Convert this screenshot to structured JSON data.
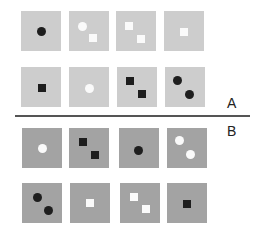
{
  "labels": {
    "a": "A",
    "b": "B"
  },
  "colors": {
    "tile_a": "#cdcdcd",
    "tile_b": "#a3a3a3",
    "black": "#1e1e1e",
    "white": "#fafafa",
    "divider": "#555555"
  },
  "sections": {
    "A": {
      "rows": [
        [
          {
            "shapes": [
              {
                "type": "circle",
                "color": "black"
              }
            ]
          },
          {
            "shapes": [
              {
                "type": "circle",
                "color": "white"
              },
              {
                "type": "square",
                "color": "white"
              }
            ]
          },
          {
            "shapes": [
              {
                "type": "square",
                "color": "white"
              },
              {
                "type": "square",
                "color": "white"
              }
            ]
          },
          {
            "shapes": [
              {
                "type": "square",
                "color": "white"
              }
            ]
          }
        ],
        [
          {
            "shapes": [
              {
                "type": "square",
                "color": "black"
              }
            ]
          },
          {
            "shapes": [
              {
                "type": "circle",
                "color": "white"
              }
            ]
          },
          {
            "shapes": [
              {
                "type": "square",
                "color": "black"
              },
              {
                "type": "square",
                "color": "black"
              }
            ]
          },
          {
            "shapes": [
              {
                "type": "circle",
                "color": "black"
              },
              {
                "type": "circle",
                "color": "black"
              }
            ]
          }
        ]
      ]
    },
    "B": {
      "rows": [
        [
          {
            "shapes": [
              {
                "type": "circle",
                "color": "white"
              }
            ]
          },
          {
            "shapes": [
              {
                "type": "square",
                "color": "black"
              },
              {
                "type": "square",
                "color": "black"
              }
            ]
          },
          {
            "shapes": [
              {
                "type": "circle",
                "color": "black"
              }
            ]
          },
          {
            "shapes": [
              {
                "type": "circle",
                "color": "white"
              },
              {
                "type": "circle",
                "color": "white"
              }
            ]
          }
        ],
        [
          {
            "shapes": [
              {
                "type": "circle",
                "color": "black"
              },
              {
                "type": "circle",
                "color": "black"
              }
            ]
          },
          {
            "shapes": [
              {
                "type": "square",
                "color": "white"
              }
            ]
          },
          {
            "shapes": [
              {
                "type": "square",
                "color": "white"
              },
              {
                "type": "square",
                "color": "white"
              }
            ]
          },
          {
            "shapes": [
              {
                "type": "square",
                "color": "black"
              }
            ]
          }
        ]
      ]
    }
  }
}
